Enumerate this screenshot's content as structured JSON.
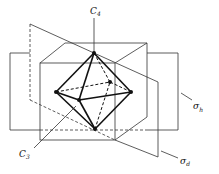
{
  "diagram": {
    "labels": {
      "c4": {
        "main": "C",
        "sub": "4"
      },
      "c3": {
        "main": "C",
        "sub": "3"
      },
      "sigma_h": {
        "main": "σ",
        "sub": "h"
      },
      "sigma_d": {
        "main": "σ",
        "sub": "d"
      }
    },
    "vertices": {
      "top": [
        94,
        53
      ],
      "bottom": [
        95,
        129
      ],
      "left": [
        56,
        92
      ],
      "right": [
        131,
        92
      ],
      "front": [
        79,
        100
      ],
      "back": [
        110,
        82
      ]
    },
    "colors": {
      "line": "#333333",
      "edge": "#111111",
      "background": "#ffffff"
    }
  }
}
